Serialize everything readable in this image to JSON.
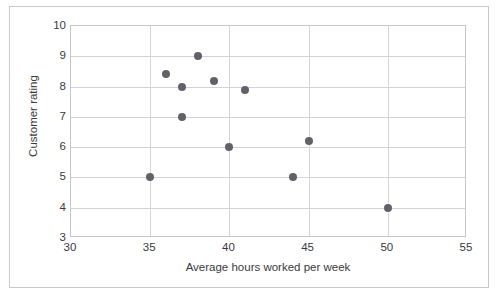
{
  "figure": {
    "scan_artifact_text": "",
    "frame": {
      "border_color": "#c9c9cd"
    }
  },
  "chart_data": {
    "type": "scatter",
    "title": "",
    "xlabel": "Average hours worked per week",
    "ylabel": "Customer rating",
    "xlim": [
      30,
      55
    ],
    "ylim": [
      3,
      10
    ],
    "xticks": [
      30,
      35,
      40,
      45,
      50,
      55
    ],
    "yticks": [
      3,
      4,
      5,
      6,
      7,
      8,
      9,
      10
    ],
    "xtick_labels": [
      "30",
      "35",
      "40",
      "45",
      "50",
      "55"
    ],
    "ytick_labels": [
      "3",
      "4",
      "5",
      "6",
      "7",
      "8",
      "9",
      "10"
    ],
    "grid": true,
    "grid_color": "#d3d3d7",
    "legend": null,
    "marker_color": "#61616a",
    "marker_size": 8,
    "points": [
      {
        "x": 35,
        "y": 5.0
      },
      {
        "x": 36,
        "y": 8.4
      },
      {
        "x": 37,
        "y": 8.0
      },
      {
        "x": 37,
        "y": 7.0
      },
      {
        "x": 38,
        "y": 9.0
      },
      {
        "x": 39,
        "y": 8.2
      },
      {
        "x": 40,
        "y": 6.0
      },
      {
        "x": 41,
        "y": 7.9
      },
      {
        "x": 44,
        "y": 5.0
      },
      {
        "x": 45,
        "y": 6.2
      },
      {
        "x": 50,
        "y": 4.0
      }
    ]
  }
}
